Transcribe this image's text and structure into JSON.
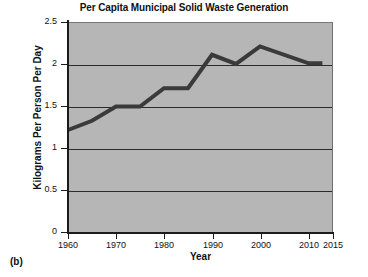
{
  "figure": {
    "label": "(b)",
    "title": "Per Capita Municipal Solid Waste Generation"
  },
  "chart_data": {
    "type": "line",
    "title": "Per Capita Municipal Solid Waste Generation",
    "xlabel": "Year",
    "ylabel": "Kilograms Per Person Per Day",
    "xlim": [
      1960,
      2015
    ],
    "ylim": [
      0,
      2.5
    ],
    "grid": true,
    "legend": false,
    "legend_position": "none",
    "plot_background": "#b6b6b6",
    "line_color": "#3a3a3a",
    "xticks": [
      1960,
      1970,
      1980,
      1990,
      2000,
      2010,
      2015
    ],
    "xtick_labels": [
      "1960",
      "1970",
      "1980",
      "1990",
      "2000",
      "2010",
      "2015"
    ],
    "yticks": [
      0,
      0.5,
      1,
      1.5,
      2,
      2.5
    ],
    "ytick_labels": [
      "0",
      "0.5",
      "1",
      "1.5",
      "2",
      "2.5"
    ],
    "gridline_values": [
      0.5,
      1,
      1.5,
      2
    ],
    "x": [
      1960,
      1965,
      1970,
      1975,
      1980,
      1985,
      1990,
      1995,
      2000,
      2010,
      2013
    ],
    "y": [
      1.22,
      1.33,
      1.5,
      1.5,
      1.72,
      1.72,
      2.12,
      2.01,
      2.22,
      2.02,
      2.02
    ],
    "series": [
      {
        "name": "Per capita MSW generation",
        "values": [
          1.22,
          1.33,
          1.5,
          1.5,
          1.72,
          1.72,
          2.12,
          2.01,
          2.22,
          2.02,
          2.02
        ]
      }
    ]
  }
}
